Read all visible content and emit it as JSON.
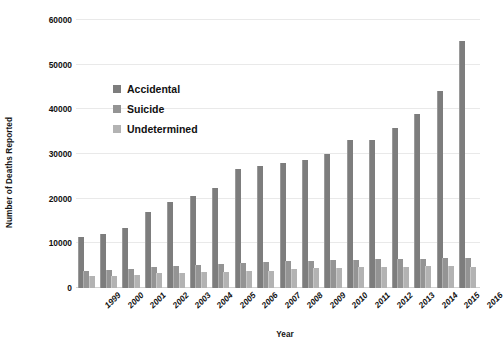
{
  "chart_data": {
    "type": "bar",
    "title": "",
    "xlabel": "Year",
    "ylabel": "Number of Deaths Reported",
    "ylim": [
      0,
      60000
    ],
    "yticks": [
      0,
      10000,
      20000,
      30000,
      40000,
      50000,
      60000
    ],
    "ytick_labels": [
      "0",
      "10000",
      "20000",
      "30000",
      "40000",
      "50000",
      "60000"
    ],
    "grid": true,
    "legend_position": "upper-left-inside",
    "categories": [
      "1999",
      "2000",
      "2001",
      "2002",
      "2003",
      "2004",
      "2005",
      "2006",
      "2007",
      "2008",
      "2009",
      "2010",
      "2011",
      "2012",
      "2013",
      "2014",
      "2015",
      "2016"
    ],
    "series": [
      {
        "name": "Accidental",
        "color": "#7d7d7d",
        "values": [
          11400,
          12000,
          13400,
          17000,
          19300,
          20600,
          22400,
          26600,
          27300,
          28100,
          28600,
          30100,
          33100,
          33200,
          35800,
          38900,
          44200,
          55300
        ]
      },
      {
        "name": "Suicide",
        "color": "#949494",
        "values": [
          3900,
          4000,
          4300,
          4700,
          4900,
          5100,
          5300,
          5700,
          5900,
          6000,
          6100,
          6200,
          6300,
          6400,
          6500,
          6600,
          6700,
          6800
        ]
      },
      {
        "name": "Undetermined",
        "color": "#b3b3b3",
        "values": [
          2600,
          2700,
          3000,
          3300,
          3400,
          3500,
          3600,
          3800,
          3900,
          4200,
          4400,
          4500,
          4600,
          4700,
          4800,
          4900,
          4900,
          4800
        ]
      }
    ]
  },
  "legend": {
    "items": [
      {
        "label": "Accidental",
        "color": "#7d7d7d"
      },
      {
        "label": "Suicide",
        "color": "#949494"
      },
      {
        "label": "Undetermined",
        "color": "#b3b3b3"
      }
    ]
  },
  "axes": {
    "y_title": "Number of Deaths Reported",
    "x_title": "Year"
  },
  "title_clipped": "Drug Overdose Deaths by Intent"
}
